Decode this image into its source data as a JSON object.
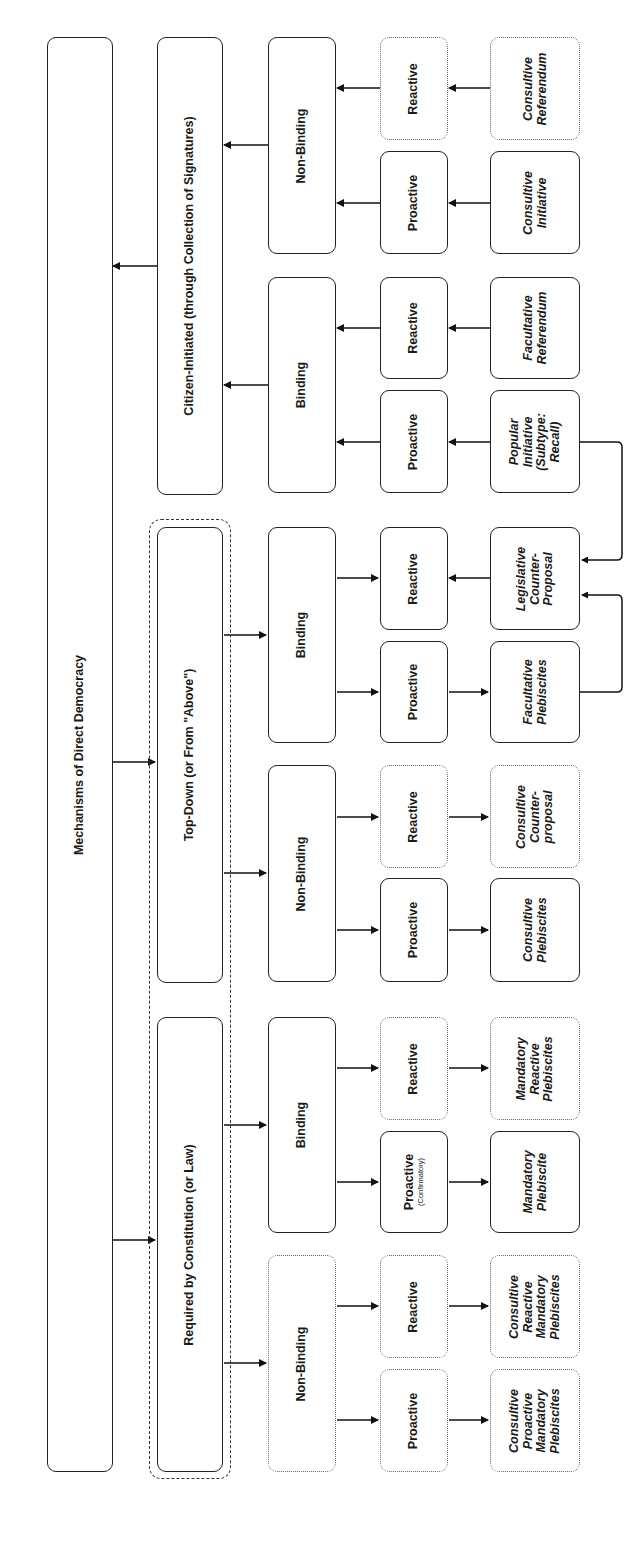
{
  "diagram": {
    "title": "Mechanisms of Direct Democracy",
    "orientation": "rotated 90 degrees counterclockwise (tree grows left-to-right on screen)",
    "colors": {
      "stroke": "#222222",
      "dotted_stroke": "#666666",
      "background": "#ffffff"
    },
    "root": {
      "label": "Mechanisms of Direct Democracy"
    },
    "branches": {
      "citizen": {
        "label": "Citizen-Initiated (through Collection of Signatures)",
        "non_binding": {
          "label": "Non-Binding",
          "reactive": {
            "label": "Reactive",
            "leaf": "Consultive Referendum",
            "leaf_lines": [
              "Consultive",
              "Referendum"
            ]
          },
          "proactive": {
            "label": "Proactive",
            "leaf": "Consultive Initiative",
            "leaf_lines": [
              "Consultive",
              "Initiative"
            ]
          }
        },
        "binding": {
          "label": "Binding",
          "reactive": {
            "label": "Reactive",
            "leaf": "Facultative Referendum",
            "leaf_lines": [
              "Facultative",
              "Referendum"
            ]
          },
          "proactive": {
            "label": "Proactive",
            "leaf": "Popular Initiative (Subtype: Recall)",
            "leaf_lines": [
              "Popular",
              "Initiative",
              "(Subtype:",
              "Recall)"
            ]
          }
        }
      },
      "top_down": {
        "label": "Top-Down (or From \"Above\")",
        "binding": {
          "label": "Binding",
          "reactive": {
            "label": "Reactive",
            "leaf": "Legislative Counter-Proposal",
            "leaf_lines": [
              "Legislative",
              "Counter-",
              "Proposal"
            ]
          },
          "proactive": {
            "label": "Proactive",
            "leaf": "Facultative Plebiscites",
            "leaf_lines": [
              "Facultative",
              "Plebiscites"
            ]
          }
        },
        "non_binding": {
          "label": "Non-Binding",
          "reactive": {
            "label": "Reactive",
            "leaf": "Consultive Counter-proposal",
            "leaf_lines": [
              "Consultive",
              "Counter-",
              "proposal"
            ]
          },
          "proactive": {
            "label": "Proactive",
            "leaf": "Consultive Plebiscites",
            "leaf_lines": [
              "Consultive",
              "Plebiscites"
            ]
          }
        }
      },
      "required": {
        "label": "Required by Constitution (or Law)",
        "binding": {
          "label": "Binding",
          "reactive": {
            "label": "Reactive",
            "leaf": "Mandatory Reactive Plebiscites",
            "leaf_lines": [
              "Mandatory",
              "Reactive",
              "Plebiscites"
            ]
          },
          "proactive": {
            "label": "Proactive",
            "sublabel": "(Confirmatory)",
            "leaf": "Mandatory Plebiscite",
            "leaf_lines": [
              "Mandatory",
              "Plebiscite"
            ]
          }
        },
        "non_binding": {
          "label": "Non-Binding",
          "reactive": {
            "label": "Reactive",
            "leaf": "Consultive Reactive Mandatory Plebiscites",
            "leaf_lines": [
              "Consultive",
              "Reactive",
              "Mandatory",
              "Plebiscites"
            ]
          },
          "proactive": {
            "label": "Proactive",
            "leaf": "Consultive Proactive Mandatory Plebiscites",
            "leaf_lines": [
              "Consultive",
              "Proactive",
              "Mandatory",
              "Plebiscites"
            ]
          }
        }
      }
    },
    "legend_notes": {
      "dotted_border": "hypothetical / not observed category",
      "dashed_frame": "groups Top-Down and Required by Constitution (state-initiated)"
    }
  }
}
